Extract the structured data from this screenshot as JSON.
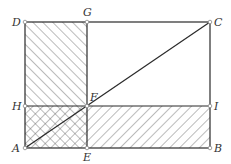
{
  "figure": {
    "type": "geometry-diagram",
    "colors": {
      "line": "#2a2a2a",
      "hatch": "#555555",
      "label": "#333333",
      "point_fill": "#ffffff"
    },
    "points": {
      "A": {
        "label": "A",
        "x": 25,
        "y": 148
      },
      "B": {
        "label": "B",
        "x": 210,
        "y": 148
      },
      "C": {
        "label": "C",
        "x": 210,
        "y": 22
      },
      "D": {
        "label": "D",
        "x": 25,
        "y": 22
      },
      "E": {
        "label": "E",
        "x": 87,
        "y": 148
      },
      "F": {
        "label": "F",
        "x": 87,
        "y": 106
      },
      "G": {
        "label": "G",
        "x": 87,
        "y": 22
      },
      "H": {
        "label": "H",
        "x": 25,
        "y": 106
      },
      "I": {
        "label": "I",
        "x": 210,
        "y": 106
      }
    },
    "segments": [
      "AB",
      "BC",
      "CD",
      "DA",
      "AC",
      "GE",
      "HI"
    ],
    "hatched_regions": [
      {
        "name": "DGFH",
        "pattern": "forward-diagonal"
      },
      {
        "name": "FIBE",
        "pattern": "back-diagonal"
      },
      {
        "name": "HFEA",
        "pattern": "cross-hatch"
      }
    ]
  }
}
